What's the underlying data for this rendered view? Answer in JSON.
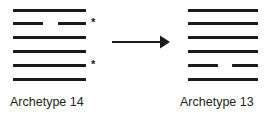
{
  "diagram": {
    "line_color": "#1a1a1a",
    "background_color": "#ffffff",
    "marker_glyph": "*",
    "arrow_direction": "right"
  },
  "left_panel": {
    "caption": "Archetype 14",
    "row_count": 6,
    "rows": [
      {
        "index": 1,
        "segments": [
          {
            "x": 13,
            "width": 73
          }
        ]
      },
      {
        "index": 2,
        "segments": [
          {
            "x": 13,
            "width": 30
          },
          {
            "x": 58,
            "width": 28
          }
        ]
      },
      {
        "index": 3,
        "segments": [
          {
            "x": 13,
            "width": 73
          }
        ]
      },
      {
        "index": 4,
        "segments": [
          {
            "x": 13,
            "width": 73
          }
        ]
      },
      {
        "index": 5,
        "segments": [
          {
            "x": 13,
            "width": 73
          }
        ]
      },
      {
        "index": 6,
        "segments": [
          {
            "x": 13,
            "width": 73
          }
        ]
      }
    ],
    "row_y": [
      9,
      22,
      36,
      50,
      64,
      78
    ],
    "markers": [
      {
        "glyph": "*",
        "x": 91,
        "y": 17,
        "row": 2
      },
      {
        "glyph": "*",
        "x": 91,
        "y": 59,
        "row": 5
      }
    ]
  },
  "right_panel": {
    "caption": "Archetype 13",
    "row_count": 6,
    "rows": [
      {
        "index": 1,
        "segments": [
          {
            "x": 18,
            "width": 70
          }
        ]
      },
      {
        "index": 2,
        "segments": [
          {
            "x": 18,
            "width": 70
          }
        ]
      },
      {
        "index": 3,
        "segments": [
          {
            "x": 18,
            "width": 70
          }
        ]
      },
      {
        "index": 4,
        "segments": [
          {
            "x": 18,
            "width": 70
          }
        ]
      },
      {
        "index": 5,
        "segments": [
          {
            "x": 18,
            "width": 30
          },
          {
            "x": 62,
            "width": 26
          }
        ]
      },
      {
        "index": 6,
        "segments": [
          {
            "x": 18,
            "width": 70
          }
        ]
      }
    ],
    "row_y": [
      9,
      22,
      36,
      50,
      64,
      78
    ],
    "markers": []
  },
  "chart_data": {
    "type": "diagram",
    "panels": [
      {
        "label": "Archetype 14",
        "bars": [
          {
            "row": 1,
            "segments": 1,
            "full_width": true
          },
          {
            "row": 2,
            "segments": 2,
            "full_width": false
          },
          {
            "row": 3,
            "segments": 1,
            "full_width": true
          },
          {
            "row": 4,
            "segments": 1,
            "full_width": true
          },
          {
            "row": 5,
            "segments": 1,
            "full_width": true
          },
          {
            "row": 6,
            "segments": 1,
            "full_width": true
          }
        ],
        "marked_rows": [
          2,
          5
        ]
      },
      {
        "label": "Archetype 13",
        "bars": [
          {
            "row": 1,
            "segments": 1,
            "full_width": true
          },
          {
            "row": 2,
            "segments": 1,
            "full_width": true
          },
          {
            "row": 3,
            "segments": 1,
            "full_width": true
          },
          {
            "row": 4,
            "segments": 1,
            "full_width": true
          },
          {
            "row": 5,
            "segments": 2,
            "full_width": false
          },
          {
            "row": 6,
            "segments": 1,
            "full_width": true
          }
        ],
        "marked_rows": []
      }
    ]
  }
}
